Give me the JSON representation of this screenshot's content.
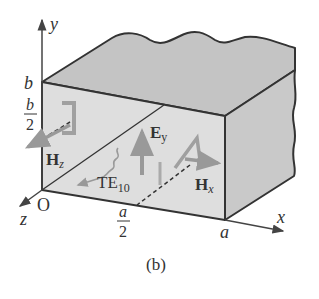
{
  "figure": {
    "caption": "(b)"
  },
  "axes": {
    "x_label": "x",
    "y_label": "y",
    "z_label": "z",
    "origin_label": "O"
  },
  "dimensions": {
    "b": "b",
    "b_half_num": "b",
    "b_half_den": "2",
    "a": "a",
    "a_half_num": "a",
    "a_half_den": "2"
  },
  "fields": {
    "ey_main": "E",
    "ey_sub": "y",
    "hz_main": "H",
    "hz_sub": "z",
    "hx_main": "H",
    "hx_sub": "x",
    "mode_main": "TE",
    "mode_sub": "10"
  },
  "colors": {
    "outline": "#333333",
    "top_face": "#c4c4c4",
    "front_face": "#dcdcdc",
    "right_face": "#c8c8c8",
    "field_arrow": "#9a9a9a"
  }
}
